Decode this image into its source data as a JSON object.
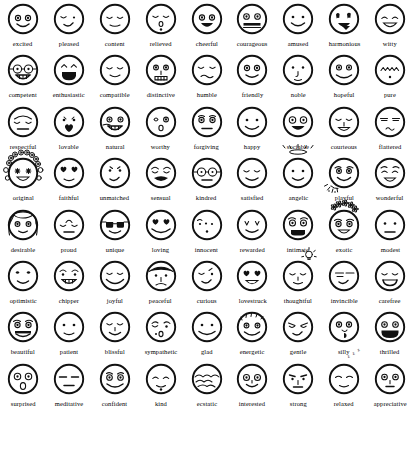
{
  "page": {
    "background_color": "#ffffff",
    "ink_color": "#111111",
    "columns": 9,
    "rows": 9,
    "total_faces": 81
  },
  "faces": [
    {
      "label": "excited",
      "icon": "face-excited-icon",
      "row": 1,
      "col": 1
    },
    {
      "label": "pleased",
      "icon": "face-pleased-icon",
      "row": 1,
      "col": 2
    },
    {
      "label": "content",
      "icon": "face-content-icon",
      "row": 1,
      "col": 3
    },
    {
      "label": "relieved",
      "icon": "face-relieved-icon",
      "row": 1,
      "col": 4
    },
    {
      "label": "cheerful",
      "icon": "face-cheerful-icon",
      "row": 1,
      "col": 5
    },
    {
      "label": "courageous",
      "icon": "face-courageous-icon",
      "row": 1,
      "col": 6
    },
    {
      "label": "amused",
      "icon": "face-amused-icon",
      "row": 1,
      "col": 7
    },
    {
      "label": "harmonious",
      "icon": "face-harmonious-icon",
      "row": 1,
      "col": 8
    },
    {
      "label": "witty",
      "icon": "face-witty-icon",
      "row": 1,
      "col": 9
    },
    {
      "label": "competent",
      "icon": "face-competent-icon",
      "row": 2,
      "col": 1
    },
    {
      "label": "enthusiastic",
      "icon": "face-enthusiastic-icon",
      "row": 2,
      "col": 2
    },
    {
      "label": "compatible",
      "icon": "face-compatible-icon",
      "row": 2,
      "col": 3
    },
    {
      "label": "distinctive",
      "icon": "face-distinctive-icon",
      "row": 2,
      "col": 4
    },
    {
      "label": "humble",
      "icon": "face-humble-icon",
      "row": 2,
      "col": 5
    },
    {
      "label": "friendly",
      "icon": "face-friendly-icon",
      "row": 2,
      "col": 6
    },
    {
      "label": "noble",
      "icon": "face-noble-icon",
      "row": 2,
      "col": 7
    },
    {
      "label": "hopeful",
      "icon": "face-hopeful-icon",
      "row": 2,
      "col": 8
    },
    {
      "label": "pure",
      "icon": "face-pure-icon",
      "row": 2,
      "col": 9
    },
    {
      "label": "respectful",
      "icon": "face-respectful-icon",
      "row": 3,
      "col": 1
    },
    {
      "label": "lovable",
      "icon": "face-lovable-icon",
      "row": 3,
      "col": 2
    },
    {
      "label": "natural",
      "icon": "face-natural-icon",
      "row": 3,
      "col": 3
    },
    {
      "label": "worthy",
      "icon": "face-worthy-icon",
      "row": 3,
      "col": 4
    },
    {
      "label": "forgiving",
      "icon": "face-forgiving-icon",
      "row": 3,
      "col": 5
    },
    {
      "label": "happy",
      "icon": "face-happy-icon",
      "row": 3,
      "col": 6
    },
    {
      "label": "sociable",
      "icon": "face-sociable-icon",
      "row": 3,
      "col": 7
    },
    {
      "label": "courteous",
      "icon": "face-courteous-icon",
      "row": 3,
      "col": 8
    },
    {
      "label": "flattered",
      "icon": "face-flattered-icon",
      "row": 3,
      "col": 9
    },
    {
      "label": "original",
      "icon": "face-original-icon",
      "row": 4,
      "col": 1
    },
    {
      "label": "faithful",
      "icon": "face-faithful-icon",
      "row": 4,
      "col": 2
    },
    {
      "label": "unmatched",
      "icon": "face-unmatched-icon",
      "row": 4,
      "col": 3
    },
    {
      "label": "sensual",
      "icon": "face-sensual-icon",
      "row": 4,
      "col": 4
    },
    {
      "label": "kindred",
      "icon": "face-kindred-icon",
      "row": 4,
      "col": 5
    },
    {
      "label": "satisfied",
      "icon": "face-satisfied-icon",
      "row": 4,
      "col": 6
    },
    {
      "label": "angelic",
      "icon": "face-angelic-icon",
      "row": 4,
      "col": 7
    },
    {
      "label": "playful",
      "icon": "face-playful-icon",
      "row": 4,
      "col": 8
    },
    {
      "label": "wonderful",
      "icon": "face-wonderful-icon",
      "row": 4,
      "col": 9
    },
    {
      "label": "desirable",
      "icon": "face-desirable-icon",
      "row": 5,
      "col": 1
    },
    {
      "label": "proud",
      "icon": "face-proud-icon",
      "row": 5,
      "col": 2
    },
    {
      "label": "unique",
      "icon": "face-unique-icon",
      "row": 5,
      "col": 3
    },
    {
      "label": "loving",
      "icon": "face-loving-icon",
      "row": 5,
      "col": 4
    },
    {
      "label": "innocent",
      "icon": "face-innocent-icon",
      "row": 5,
      "col": 5
    },
    {
      "label": "rewarded",
      "icon": "face-rewarded-icon",
      "row": 5,
      "col": 6
    },
    {
      "label": "intimate",
      "icon": "face-intimate-icon",
      "row": 5,
      "col": 7
    },
    {
      "label": "exotic",
      "icon": "face-exotic-icon",
      "row": 5,
      "col": 8
    },
    {
      "label": "modest",
      "icon": "face-modest-icon",
      "row": 5,
      "col": 9
    },
    {
      "label": "optimistic",
      "icon": "face-optimistic-icon",
      "row": 6,
      "col": 1
    },
    {
      "label": "chipper",
      "icon": "face-chipper-icon",
      "row": 6,
      "col": 2
    },
    {
      "label": "joyful",
      "icon": "face-joyful-icon",
      "row": 6,
      "col": 3
    },
    {
      "label": "peaceful",
      "icon": "face-peaceful-icon",
      "row": 6,
      "col": 4
    },
    {
      "label": "curious",
      "icon": "face-curious-icon",
      "row": 6,
      "col": 5
    },
    {
      "label": "lovestruck",
      "icon": "face-lovestruck-icon",
      "row": 6,
      "col": 6
    },
    {
      "label": "thoughtful",
      "icon": "face-thoughtful-icon",
      "row": 6,
      "col": 7
    },
    {
      "label": "invincible",
      "icon": "face-invincible-icon",
      "row": 6,
      "col": 8
    },
    {
      "label": "carefree",
      "icon": "face-carefree-icon",
      "row": 6,
      "col": 9
    },
    {
      "label": "beautiful",
      "icon": "face-beautiful-icon",
      "row": 7,
      "col": 1
    },
    {
      "label": "patient",
      "icon": "face-patient-icon",
      "row": 7,
      "col": 2
    },
    {
      "label": "blissful",
      "icon": "face-blissful-icon",
      "row": 7,
      "col": 3
    },
    {
      "label": "sympathetic",
      "icon": "face-sympathetic-icon",
      "row": 7,
      "col": 4
    },
    {
      "label": "glad",
      "icon": "face-glad-icon",
      "row": 7,
      "col": 5
    },
    {
      "label": "energetic",
      "icon": "face-energetic-icon",
      "row": 7,
      "col": 6
    },
    {
      "label": "gentle",
      "icon": "face-gentle-icon",
      "row": 7,
      "col": 7
    },
    {
      "label": "silly",
      "icon": "face-silly-icon",
      "row": 7,
      "col": 8
    },
    {
      "label": "thrilled",
      "icon": "face-thrilled-icon",
      "row": 7,
      "col": 9
    },
    {
      "label": "surprised",
      "icon": "face-surprised-icon",
      "row": 8,
      "col": 1
    },
    {
      "label": "meditative",
      "icon": "face-meditative-icon",
      "row": 8,
      "col": 2
    },
    {
      "label": "confident",
      "icon": "face-confident-icon",
      "row": 8,
      "col": 3
    },
    {
      "label": "kind",
      "icon": "face-kind-icon",
      "row": 8,
      "col": 4
    },
    {
      "label": "ecstatic",
      "icon": "face-ecstatic-icon",
      "row": 8,
      "col": 5
    },
    {
      "label": "interested",
      "icon": "face-interested-icon",
      "row": 8,
      "col": 6
    },
    {
      "label": "strong",
      "icon": "face-strong-icon",
      "row": 8,
      "col": 7
    },
    {
      "label": "relaxed",
      "icon": "face-relaxed-icon",
      "row": 8,
      "col": 8
    },
    {
      "label": "appreciative",
      "icon": "face-appreciative-icon",
      "row": 8,
      "col": 9
    }
  ],
  "annotations": {
    "relaxed_sleep_text": "z z z",
    "angelic_feature": "halo",
    "thoughtful_feature": "lightbulb",
    "original_feature": "flower-crown",
    "exotic_feature": "flower-headdress",
    "playful_feature": "confetti"
  }
}
